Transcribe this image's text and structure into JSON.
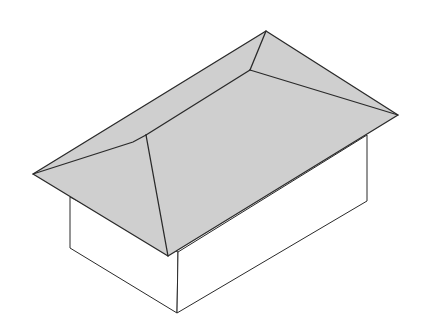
{
  "diagram": {
    "colors": {
      "background": "#ffffff",
      "roof_fill": "#cfcfcf",
      "wall_fill": "#ffffff",
      "stroke": "#2a2a2a"
    }
  }
}
